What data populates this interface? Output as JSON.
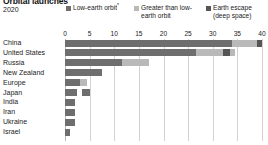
{
  "header": {
    "title": "Orbital launches",
    "subtitle": "2020"
  },
  "legend": {
    "position": "top",
    "items": [
      {
        "label": "Low-earth orbit",
        "footnote": "*",
        "color": "#6e6e6e",
        "key": "leo"
      },
      {
        "label": "Greater than low-earth orbit",
        "footnote": "",
        "color": "#b9b9b9",
        "key": "gleo"
      },
      {
        "label": "Earth escape (deep space)",
        "footnote": "",
        "color": "#555555",
        "key": "escape"
      }
    ]
  },
  "axis": {
    "ticks": [
      "0",
      "5",
      "10",
      "15",
      "20",
      "25",
      "30",
      "35",
      "40"
    ],
    "min": 0,
    "max": 40
  },
  "chart_data": {
    "type": "bar",
    "orientation": "horizontal",
    "stacked": true,
    "title": "Orbital launches",
    "subtitle": "2020",
    "xlabel": "",
    "ylabel": "",
    "xlim": [
      0,
      40
    ],
    "grid": true,
    "legend_position": "top",
    "categories": [
      "China",
      "United States",
      "Russia",
      "New Zealand",
      "Europe",
      "Japan",
      "India",
      "Iran",
      "Ukraine",
      "Israel"
    ],
    "series": [
      {
        "name": "Low-earth orbit",
        "color": "#6e6e6e",
        "values": [
          34,
          27,
          11.5,
          8,
          3,
          2.5,
          2,
          2,
          2,
          1
        ]
      },
      {
        "name": "Greater than low-earth orbit",
        "color": "#b9b9b9",
        "values": [
          5,
          8,
          5,
          0,
          1.5,
          0.5,
          0,
          0,
          0,
          0
        ]
      },
      {
        "name": "Earth escape (deep space)",
        "color": "#555555",
        "values": [
          1,
          1,
          0,
          0,
          0,
          1,
          0,
          0,
          0,
          0
        ]
      }
    ],
    "bars": [
      {
        "category": "China",
        "segments": [
          {
            "key": "leo",
            "start": 0,
            "length": 34,
            "color": "#6e6e6e"
          },
          {
            "key": "gleo",
            "start": 34,
            "length": 5,
            "color": "#b9b9b9"
          },
          {
            "key": "escape",
            "start": 39,
            "length": 1,
            "color": "#555555"
          }
        ]
      },
      {
        "category": "United States",
        "segments": [
          {
            "key": "leo",
            "start": 0,
            "length": 26.5,
            "color": "#6e6e6e"
          },
          {
            "key": "gleo",
            "start": 26.5,
            "length": 5.5,
            "color": "#b9b9b9"
          },
          {
            "key": "escape",
            "start": 32,
            "length": 1.5,
            "color": "#555555"
          },
          {
            "key": "gleo",
            "start": 33.5,
            "length": 1,
            "color": "#b9b9b9"
          }
        ]
      },
      {
        "category": "Russia",
        "segments": [
          {
            "key": "leo",
            "start": 0,
            "length": 11.5,
            "color": "#6e6e6e"
          },
          {
            "key": "gleo",
            "start": 11.5,
            "length": 5.5,
            "color": "#b9b9b9"
          }
        ]
      },
      {
        "category": "New Zealand",
        "segments": [
          {
            "key": "leo",
            "start": 0,
            "length": 7.5,
            "color": "#6e6e6e"
          }
        ]
      },
      {
        "category": "Europe",
        "segments": [
          {
            "key": "leo",
            "start": 0,
            "length": 3,
            "color": "#6e6e6e"
          },
          {
            "key": "gleo",
            "start": 3,
            "length": 1.5,
            "color": "#b9b9b9"
          }
        ]
      },
      {
        "category": "Japan",
        "segments": [
          {
            "key": "leo",
            "start": 0,
            "length": 2.5,
            "color": "#6e6e6e"
          },
          {
            "key": "escape",
            "start": 3.5,
            "length": 1.5,
            "color": "#6e6e6e"
          }
        ]
      },
      {
        "category": "India",
        "segments": [
          {
            "key": "leo",
            "start": 0,
            "length": 2,
            "color": "#6e6e6e"
          }
        ]
      },
      {
        "category": "Iran",
        "segments": [
          {
            "key": "leo",
            "start": 0,
            "length": 2,
            "color": "#6e6e6e"
          }
        ]
      },
      {
        "category": "Ukraine",
        "segments": [
          {
            "key": "leo",
            "start": 0,
            "length": 2,
            "color": "#6e6e6e"
          }
        ]
      },
      {
        "category": "Israel",
        "segments": [
          {
            "key": "leo",
            "start": 0,
            "length": 1,
            "color": "#6e6e6e"
          }
        ]
      }
    ]
  }
}
